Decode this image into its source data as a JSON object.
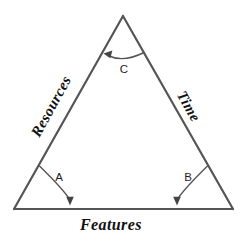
{
  "diagram": {
    "type": "triangle-constraint-diagram",
    "background_color": "#ffffff",
    "line_color": "#555555",
    "label_color": "#111111",
    "edges": [
      {
        "id": "left",
        "label": "Resources",
        "icon": "edge-left"
      },
      {
        "id": "right",
        "label": "Time",
        "icon": "edge-right"
      },
      {
        "id": "bottom",
        "label": "Features",
        "icon": "edge-bottom"
      }
    ],
    "angles": [
      {
        "id": "A",
        "label": "A",
        "position": "bottom-left",
        "arrow": "arrowhead-down"
      },
      {
        "id": "B",
        "label": "B",
        "position": "bottom-right",
        "arrow": "arrowhead-down"
      },
      {
        "id": "C",
        "label": "C",
        "position": "apex",
        "arrow": "arrowhead-left"
      }
    ],
    "vertices": {
      "apex": {
        "x": 123,
        "y": 16
      },
      "bottom_left": {
        "x": 14,
        "y": 209
      },
      "bottom_right": {
        "x": 233,
        "y": 209
      }
    }
  }
}
